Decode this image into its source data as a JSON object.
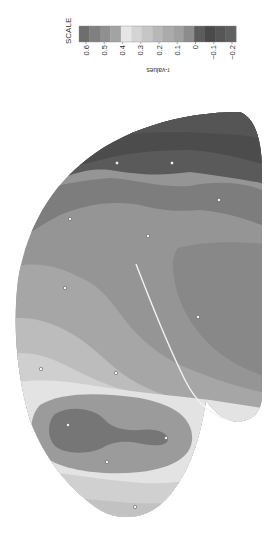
{
  "chart_data": {
    "type": "heatmap",
    "subtype": "contour-map",
    "title": "",
    "orientation": "rotated 90 degrees clockwise",
    "legend": {
      "title": "SCALE",
      "axis_label": "r-values",
      "position": "top",
      "tick_labels": [
        "0.6",
        "0.5",
        "0.4",
        "0.3",
        "0.2",
        "0.1",
        "0",
        "−0.1",
        "−0.2"
      ],
      "ticks": [
        0.6,
        0.5,
        0.4,
        0.3,
        0.2,
        0.1,
        0.0,
        -0.1,
        -0.2
      ],
      "bins": [
        {
          "range": [
            0.6,
            0.65
          ],
          "color": "#6e6e6e"
        },
        {
          "range": [
            0.55,
            0.6
          ],
          "color": "#808080"
        },
        {
          "range": [
            0.5,
            0.55
          ],
          "color": "#8f8f8f"
        },
        {
          "range": [
            0.45,
            0.5
          ],
          "color": "#a3a3a3"
        },
        {
          "range": [
            0.4,
            0.45
          ],
          "color": "#e6e6e6"
        },
        {
          "range": [
            0.35,
            0.4
          ],
          "color": "#d4d4d4"
        },
        {
          "range": [
            0.3,
            0.35
          ],
          "color": "#c6c6c6"
        },
        {
          "range": [
            0.25,
            0.3
          ],
          "color": "#b8b8b8"
        },
        {
          "range": [
            0.2,
            0.25
          ],
          "color": "#ababab"
        },
        {
          "range": [
            0.15,
            0.2
          ],
          "color": "#a0a0a0"
        },
        {
          "range": [
            0.1,
            0.15
          ],
          "color": "#8c8c8c"
        },
        {
          "range": [
            0.05,
            0.1
          ],
          "color": "#5c5c5c"
        },
        {
          "range": [
            0.0,
            0.05
          ],
          "color": "#4a4a4a"
        },
        {
          "range": [
            -0.1,
            0.0
          ],
          "color": "#565656"
        },
        {
          "range": [
            -0.2,
            -0.1
          ],
          "color": "#606060"
        }
      ]
    },
    "electrodes": [
      {
        "x": 117,
        "y": 163
      },
      {
        "x": 172,
        "y": 163
      },
      {
        "x": 219,
        "y": 200
      },
      {
        "x": 70,
        "y": 219
      },
      {
        "x": 148,
        "y": 236
      },
      {
        "x": 65,
        "y": 288
      },
      {
        "x": 198,
        "y": 317
      },
      {
        "x": 41,
        "y": 369
      },
      {
        "x": 116,
        "y": 373
      },
      {
        "x": 68,
        "y": 425
      },
      {
        "x": 166,
        "y": 438
      },
      {
        "x": 107,
        "y": 462
      },
      {
        "x": 135,
        "y": 507
      }
    ],
    "contour_fills": {
      "outer_darkest": "#4f4f4f",
      "dark": "#5e5e5e",
      "mid_dark": "#7a7a7a",
      "mid": "#959595",
      "mid_light": "#a9a9a9",
      "light": "#bdbdbd",
      "lighter": "#d0d0d0",
      "lightest": "#e4e4e4",
      "blob_outer": "#9a9a9a",
      "blob_inner": "#757575",
      "right_lobe": "#8a8a8a"
    }
  }
}
